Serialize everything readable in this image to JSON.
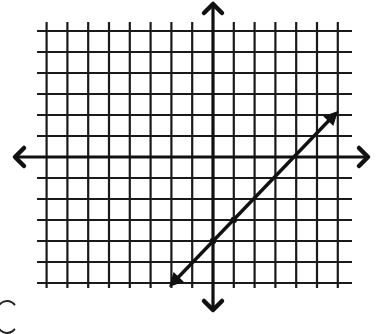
{
  "diagram": {
    "type": "coordinate-grid-with-line",
    "grid": {
      "x_min": -8,
      "x_max": 6,
      "y_min": -6,
      "y_max": 6,
      "origin_px": [
        213,
        157
      ],
      "unit_px_x": 20.8,
      "unit_px_y": 21.0,
      "grid_left_px": 37,
      "grid_right_px": 352,
      "grid_top_px": 22,
      "grid_bottom_px": 288,
      "line_color": "#1a1a1a"
    },
    "axes": {
      "x_arrow_left_px": [
        15,
        158
      ],
      "x_arrow_right_px": [
        368,
        157
      ],
      "y_arrow_top_px": [
        211,
        4
      ],
      "y_arrow_bottom_px": [
        211,
        310
      ],
      "color": "#111111"
    },
    "line": {
      "equation": "y = x - 4",
      "slope": 1,
      "y_intercept": -4,
      "start_px": [
        169,
        287
      ],
      "end_px": [
        338,
        111
      ],
      "marked_points": [
        [
          0,
          -4
        ],
        [
          1,
          -3
        ]
      ],
      "arrows_both_ends": true,
      "color": "#111111"
    }
  }
}
